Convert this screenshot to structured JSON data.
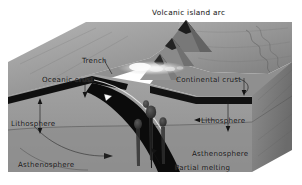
{
  "figure": {
    "title": "Volcanic island arc",
    "type": "geological-block-diagram",
    "style": "grayscale shaded 3D cutaway block",
    "canvas": {
      "width": 302,
      "height": 185
    }
  },
  "labels": {
    "title": "Volcanic island arc",
    "trench": "Trench",
    "oceanic_crust": "Oceanic crust",
    "continental_crust": "Continental crust",
    "lithosphere_left": "Lithosphere",
    "lithosphere_right": "Lithosphere",
    "asthenosphere_left": "Asthenosphere",
    "asthenosphere_right": "Asthenosphere",
    "partial_melting": "Partial melting"
  },
  "colors": {
    "background": "#ffffff",
    "block_top_light": "#a8a8a8",
    "block_top_mid": "#949494",
    "block_top_dark": "#7d7d7d",
    "front_face": "#9d9d9d",
    "front_face_lower": "#8e8e8e",
    "side_face": "#868686",
    "side_face_dark": "#6f6f6f",
    "crust_band": "#111111",
    "slab": "#0d0d0d",
    "magma_plume": "#3a3a3a",
    "eruption_glow": "#f4f4f4",
    "label_text": "#141414",
    "leader_line": "#1a1a1a"
  },
  "features": {
    "volcano_cones": 3,
    "magma_plumes": 4,
    "eruption_plume": "ash cloud over arc",
    "slab_arrow_marker": "white triangle on subducting slab",
    "mantle_flow_arrow": "curved convection arrow in asthenosphere",
    "shoreline": "wavy coastline on right block edge"
  },
  "annotations": [
    {
      "name": "trench-label",
      "text": "Trench",
      "leader": "line-to-trench-notch"
    },
    {
      "name": "oceanic-crust-label",
      "text": "Oceanic crust",
      "leader": "vertical-arrow-down-to-crust"
    },
    {
      "name": "continental-crust-label",
      "text": "Continental crust",
      "leader": "curved-line-to-crust-block"
    },
    {
      "name": "lithosphere-left-label",
      "text": "Lithosphere",
      "leader": "vertical-double-arrow"
    },
    {
      "name": "lithosphere-right-label",
      "text": "Lithosphere",
      "leader": "left-arrow-plus-vertical-double-arrow"
    },
    {
      "name": "asthenosphere-left-label",
      "text": "Asthenosphere",
      "leader": "none"
    },
    {
      "name": "asthenosphere-right-label",
      "text": "Asthenosphere",
      "leader": "none"
    },
    {
      "name": "partial-melting-label",
      "text": "Partial melting",
      "leader": "arrow-up-to-plume"
    }
  ]
}
